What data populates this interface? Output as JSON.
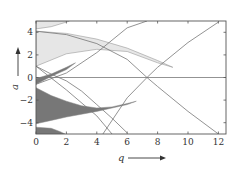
{
  "chart_data": {
    "type": "area",
    "title": "",
    "xlabel": "q",
    "ylabel": "a",
    "xlim": [
      0,
      12.5
    ],
    "ylim": [
      -5,
      5
    ],
    "x_ticks": [
      0,
      2,
      4,
      6,
      8,
      10,
      12
    ],
    "y_ticks": [
      -4,
      -2,
      0,
      2,
      4
    ],
    "x_tick_labels": [
      "0",
      "2",
      "4",
      "6",
      "8",
      "10",
      "12"
    ],
    "y_tick_labels": [
      "−4",
      "−2",
      "0",
      "2",
      "4"
    ],
    "grid": false,
    "legend": null,
    "horizontal_reference_line": 0,
    "regions": [
      {
        "name": "light stability region upper (a>4)",
        "fill": "#e6e6e6",
        "points": [
          [
            0,
            5
          ],
          [
            0,
            4.3
          ],
          [
            1,
            4.5
          ],
          [
            2,
            4.9
          ],
          [
            2.2,
            5
          ]
        ]
      },
      {
        "name": "light stability region (a 1–4)",
        "fill": "#e6e6e6",
        "points": [
          [
            0,
            4.1
          ],
          [
            2,
            3.9
          ],
          [
            4,
            3.4
          ],
          [
            6,
            2.6
          ],
          [
            8,
            1.5
          ],
          [
            9,
            0.9
          ],
          [
            8,
            1.3
          ],
          [
            6,
            2.3
          ],
          [
            4,
            2.5
          ],
          [
            2,
            2.1
          ],
          [
            0,
            1.0
          ]
        ]
      },
      {
        "name": "dark stability region near a=0",
        "fill": "#777777",
        "points": [
          [
            0,
            -0.1
          ],
          [
            1,
            0.3
          ],
          [
            2,
            0.9
          ],
          [
            2.6,
            1.3
          ],
          [
            2,
            0.7
          ],
          [
            1,
            0.1
          ],
          [
            0,
            -0.6
          ]
        ]
      },
      {
        "name": "dark stability region (a −1 to −4)",
        "fill": "#777777",
        "points": [
          [
            0,
            -0.9
          ],
          [
            1,
            -1.6
          ],
          [
            2,
            -2.1
          ],
          [
            3,
            -2.5
          ],
          [
            4,
            -2.7
          ],
          [
            5,
            -2.6
          ],
          [
            6,
            -2.3
          ],
          [
            6.6,
            -2.1
          ],
          [
            6,
            -2.4
          ],
          [
            4,
            -3.0
          ],
          [
            2,
            -3.5
          ],
          [
            1,
            -3.8
          ],
          [
            0,
            -4.1
          ]
        ]
      },
      {
        "name": "dark stability region lower (a<−4)",
        "fill": "#777777",
        "points": [
          [
            0,
            -4.4
          ],
          [
            1,
            -4.5
          ],
          [
            1.6,
            -4.8
          ],
          [
            1.9,
            -5
          ],
          [
            0,
            -5
          ]
        ]
      }
    ],
    "curves": [
      {
        "name": "rising boundary",
        "points": [
          [
            0,
            -0.6
          ],
          [
            2,
            0.4
          ],
          [
            4,
            2.2
          ],
          [
            6,
            4.4
          ],
          [
            7.3,
            5.0
          ]
        ]
      },
      {
        "name": "crossing line up",
        "points": [
          [
            4.4,
            -5
          ],
          [
            6,
            -1.8
          ],
          [
            7.3,
            0
          ],
          [
            8,
            0.9
          ],
          [
            10,
            3.1
          ],
          [
            12,
            4.9
          ]
        ]
      },
      {
        "name": "crossing line down",
        "points": [
          [
            0,
            1.0
          ],
          [
            2,
            -1.1
          ],
          [
            4,
            -3.4
          ],
          [
            5,
            -5
          ]
        ]
      },
      {
        "name": "crossing line down 2",
        "points": [
          [
            0,
            4.1
          ],
          [
            2,
            3.8
          ],
          [
            4,
            3.0
          ],
          [
            6,
            1.6
          ],
          [
            7.3,
            0
          ],
          [
            8,
            -0.8
          ],
          [
            10,
            -3.0
          ],
          [
            12,
            -5
          ]
        ]
      },
      {
        "name": "lower diagonal",
        "points": [
          [
            0,
            1.0
          ],
          [
            1,
            0.3
          ],
          [
            2,
            -0.3
          ],
          [
            3,
            -1.2
          ],
          [
            4,
            -2.4
          ],
          [
            5,
            -3.6
          ],
          [
            6,
            -4.9
          ]
        ]
      }
    ],
    "annotations": [
      {
        "text": "q ⟶",
        "position": "below x-axis"
      },
      {
        "text": "a ⟶",
        "position": "left of y-axis, rotated"
      }
    ]
  },
  "axes": {
    "x_label": "q",
    "y_label": "a"
  }
}
